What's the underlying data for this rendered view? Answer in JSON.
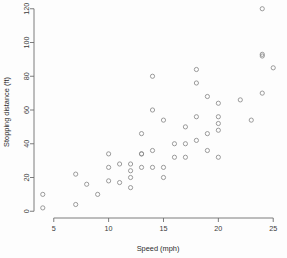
{
  "chart_data": {
    "type": "scatter",
    "title": "",
    "xlabel": "Speed (mph)",
    "ylabel": "Stopping distance (ft)",
    "xlim": [
      3.2,
      25.8
    ],
    "ylim": [
      -4,
      124
    ],
    "xticks": [
      5,
      10,
      15,
      20,
      25
    ],
    "xtick_labels": [
      "5",
      "10",
      "15",
      "20",
      "25"
    ],
    "yticks": [
      0,
      20,
      40,
      60,
      80,
      100,
      120
    ],
    "ytick_labels": [
      "0",
      "20",
      "40",
      "60",
      "80",
      "100",
      "120"
    ],
    "grid": false,
    "legend": false,
    "marker": "open-circle",
    "marker_color": "#8a8a8a",
    "background_color": "#fdfdfd",
    "x": [
      4,
      4,
      7,
      7,
      8,
      9,
      10,
      10,
      10,
      11,
      11,
      12,
      12,
      12,
      12,
      13,
      13,
      13,
      13,
      14,
      14,
      14,
      14,
      15,
      15,
      15,
      16,
      16,
      17,
      17,
      17,
      18,
      18,
      18,
      18,
      19,
      19,
      19,
      20,
      20,
      20,
      20,
      20,
      22,
      23,
      24,
      24,
      24,
      24,
      25
    ],
    "y": [
      2,
      10,
      4,
      22,
      16,
      10,
      18,
      26,
      34,
      17,
      28,
      14,
      20,
      24,
      28,
      26,
      34,
      34,
      46,
      26,
      36,
      60,
      80,
      20,
      26,
      54,
      32,
      40,
      32,
      40,
      50,
      42,
      56,
      76,
      84,
      36,
      46,
      68,
      32,
      48,
      52,
      56,
      64,
      66,
      54,
      70,
      92,
      93,
      120,
      85
    ]
  },
  "axis_labels": {
    "x_title": "Speed (mph)",
    "y_title": "Stopping distance (ft)"
  }
}
